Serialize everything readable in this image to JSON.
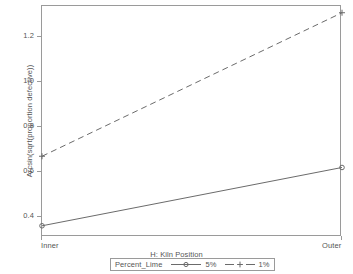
{
  "chart_data": {
    "type": "line",
    "title": "",
    "xlabel": "H: Kiln Position",
    "ylabel": "Arcsin(sqrt(proportion defective))",
    "categories": [
      "Inner",
      "Outer"
    ],
    "xtick_labels": [
      "Inner",
      "Outer"
    ],
    "ytick_labels": [
      "0.4",
      "0.6",
      "0.8",
      "1.0",
      "1.2"
    ],
    "ytick_values": [
      0.4,
      0.6,
      0.8,
      1.0,
      1.2
    ],
    "ylim": [
      0.31,
      1.34
    ],
    "grid": false,
    "legend_position": "bottom-outside",
    "legend_title": "Percent_Lime",
    "series": [
      {
        "name": "5%",
        "values": [
          0.36,
          0.62
        ],
        "linestyle": "solid",
        "marker": "circle",
        "color": "#6b6b6b"
      },
      {
        "name": "1%",
        "values": [
          0.67,
          1.31
        ],
        "linestyle": "dashed",
        "marker": "plus",
        "color": "#6b6b6b"
      }
    ]
  },
  "axes": {
    "y_title": "Arcsin(sqrt(proportion defective))",
    "x_title": "H: Kiln Position"
  },
  "legend": {
    "title": "Percent_Lime",
    "entries": [
      {
        "label": "5%"
      },
      {
        "label": "1%"
      }
    ]
  },
  "colors": {
    "axis": "#9a9a9a",
    "line": "#6b6b6b",
    "text": "#555555",
    "background": "#ffffff"
  }
}
